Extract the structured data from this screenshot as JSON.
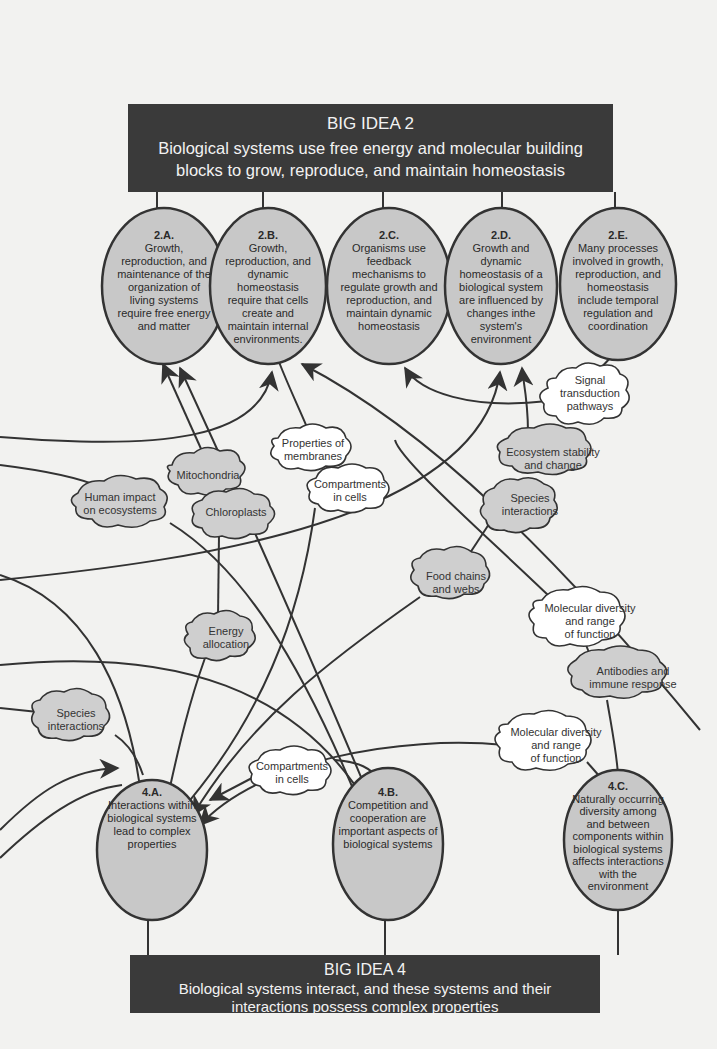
{
  "colors": {
    "background": "#f2f2f0",
    "banner": "#3a3a3a",
    "banner_text": "#f2f2f2",
    "ellipse_fill": "#c8c8c8",
    "cloud_gray_fill": "#cfcfcf",
    "cloud_white_fill": "#ffffff",
    "stroke": "#333333"
  },
  "big_idea_2": {
    "title": "BIG IDEA 2",
    "line1": "Biological systems use free energy and molecular building",
    "line2": "blocks to grow, reproduce, and maintain homeostasis"
  },
  "big_idea_4": {
    "title": "BIG IDEA 4",
    "line1": "Biological systems interact, and these systems and their",
    "line2": "interactions possess complex properties"
  },
  "top_ellipses": [
    {
      "id": "2.A.",
      "lines": [
        "Growth,",
        "reproduction, and",
        "maintenance of the",
        "organization of",
        "living systems",
        "require free energy",
        "and matter"
      ]
    },
    {
      "id": "2.B.",
      "lines": [
        "Growth,",
        "reproduction, and",
        "dynamic",
        "homeostasis",
        "require that cells",
        "create and",
        "maintain internal",
        "environments."
      ]
    },
    {
      "id": "2.C.",
      "lines": [
        "Organisms use",
        "feedback",
        "mechanisms to",
        "regulate growth and",
        "reproduction, and",
        "maintain dynamic",
        "homeostasis"
      ]
    },
    {
      "id": "2.D.",
      "lines": [
        "Growth and",
        "dynamic",
        "homeostasis of a",
        "biological system",
        "are influenced by",
        "changes inthe",
        "system's",
        "environment"
      ]
    },
    {
      "id": "2.E.",
      "lines": [
        "Many processes",
        "involved in growth,",
        "reproduction, and",
        "homeostasis",
        "include temporal",
        "regulation and",
        "coordination"
      ]
    }
  ],
  "bottom_ellipses": [
    {
      "id": "4.A.",
      "lines": [
        "Interactions within",
        "biological systems",
        "lead to complex",
        "properties"
      ]
    },
    {
      "id": "4.B.",
      "lines": [
        "Competition and",
        "cooperation are",
        "important aspects of",
        "biological systems"
      ]
    },
    {
      "id": "4.C.",
      "lines": [
        "Naturally occurring",
        "diversity among",
        "and between",
        "components within",
        "biological systems",
        "affects interactions",
        "with the",
        "environment"
      ]
    }
  ],
  "clouds": [
    {
      "name": "signal-transduction",
      "lines": [
        "Signal",
        "transduction",
        "pathways"
      ],
      "fill": "white"
    },
    {
      "name": "properties-of-membranes",
      "lines": [
        "Properties of",
        "membranes"
      ],
      "fill": "white"
    },
    {
      "name": "mitochondria",
      "lines": [
        "Mitochondria"
      ],
      "fill": "gray"
    },
    {
      "name": "human-impact",
      "lines": [
        "Human impact",
        "on ecosystems"
      ],
      "fill": "gray"
    },
    {
      "name": "chloroplasts",
      "lines": [
        "Chloroplasts"
      ],
      "fill": "gray"
    },
    {
      "name": "compartments-upper",
      "lines": [
        "Compartments",
        "in cells"
      ],
      "fill": "white"
    },
    {
      "name": "ecosystem-stability",
      "lines": [
        "Ecosystem stability",
        "and change"
      ],
      "fill": "gray"
    },
    {
      "name": "species-interactions-right",
      "lines": [
        "Species",
        "interactions"
      ],
      "fill": "gray"
    },
    {
      "name": "food-chains",
      "lines": [
        "Food chains",
        "and webs"
      ],
      "fill": "gray"
    },
    {
      "name": "energy-allocation",
      "lines": [
        "Energy",
        "allocation"
      ],
      "fill": "gray"
    },
    {
      "name": "molecular-diversity-upper",
      "lines": [
        "Molecular diversity",
        "and range",
        "of function"
      ],
      "fill": "white"
    },
    {
      "name": "antibodies",
      "lines": [
        "Antibodies and",
        "immune response"
      ],
      "fill": "gray"
    },
    {
      "name": "species-interactions-left",
      "lines": [
        "Species",
        "interactions"
      ],
      "fill": "gray"
    },
    {
      "name": "molecular-diversity-lower",
      "lines": [
        "Molecular diversity",
        "and range",
        "of function"
      ],
      "fill": "white"
    },
    {
      "name": "compartments-lower",
      "lines": [
        "Compartments",
        "in cells"
      ],
      "fill": "white"
    }
  ]
}
